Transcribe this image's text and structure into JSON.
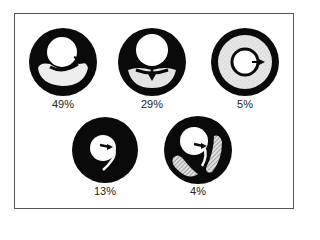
{
  "figure": {
    "colors": {
      "ring": "#0a0a0a",
      "lumen": "#ffffff",
      "stipple": "#d9d9d9",
      "hatch": "#9a9a9a",
      "frame": "#555555"
    },
    "panels": [
      {
        "id": "p1",
        "label": "49%",
        "cx": 63,
        "cy": 62,
        "description": "crescent lumen below central circle, arrow pointing right"
      },
      {
        "id": "p2",
        "label": "29%",
        "cx": 152,
        "cy": 62,
        "description": "crescent lumen below central circle, arrow pointing down"
      },
      {
        "id": "p3",
        "label": "5%",
        "cx": 245,
        "cy": 62,
        "description": "concentric stippled ring with inner circle and arrow"
      },
      {
        "id": "p4",
        "label": "13%",
        "cx": 105,
        "cy": 150,
        "description": "small central lumen with thin curved channel"
      },
      {
        "id": "p5",
        "label": "4%",
        "cx": 198,
        "cy": 150,
        "description": "central lumen with two hatched crescents"
      }
    ]
  }
}
